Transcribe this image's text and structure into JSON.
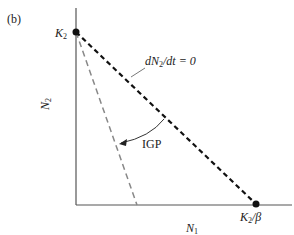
{
  "panel_label": "(b)",
  "axes": {
    "x_label": "N",
    "x_label_sub": "1",
    "y_label": "N",
    "y_label_sub": "2"
  },
  "points": {
    "y_intercept": {
      "label": "K",
      "sub": "2"
    },
    "x_intercept": {
      "label": "K",
      "sub": "2",
      "suffix": "/β"
    }
  },
  "isocline": {
    "label_pre": "dN",
    "label_sub": "2",
    "label_post": "/dt = 0"
  },
  "arrow_label": "IGP",
  "colors": {
    "axis": "#555555",
    "isocline": "#111111",
    "shifted_line": "#777777",
    "arrow": "#333333"
  }
}
